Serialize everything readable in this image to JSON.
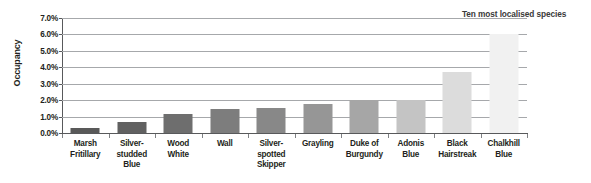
{
  "chart_data": {
    "type": "bar",
    "title": "Ten most localised species",
    "xlabel": "",
    "ylabel": "Occupancy",
    "ylim": [
      0,
      7
    ],
    "grid": true,
    "legend": false,
    "y_tick_labels": [
      "7.0%",
      "6.0%",
      "5.0%",
      "4.0%",
      "3.0%",
      "2.0%",
      "1.0%",
      "0.0%"
    ],
    "y_ticks": [
      7.0,
      6.0,
      5.0,
      4.0,
      3.0,
      2.0,
      1.0,
      0.0
    ],
    "categories": [
      "Marsh\nFritillary",
      "Silver-\nstudded\nBlue",
      "Wood\nWhite",
      "Wall",
      "Silver-\nspotted\nSkipper",
      "Grayling",
      "Duke of\nBurgundy",
      "Adonis\nBlue",
      "Black\nHairstreak",
      "Chalkhill\nBlue"
    ],
    "values": [
      0.3,
      0.65,
      1.15,
      1.45,
      1.5,
      1.75,
      2.0,
      2.0,
      3.7,
      6.0
    ],
    "bar_colors": [
      "#595959",
      "#616161",
      "#6e6e6e",
      "#7d7d7d",
      "#888888",
      "#969696",
      "#a6a6a6",
      "#c4c4c4",
      "#dcdcdc",
      "#f1f1f1"
    ]
  },
  "caption": {
    "text": "Ten most localised species"
  },
  "axes": {
    "y_title": "Occupancy"
  }
}
